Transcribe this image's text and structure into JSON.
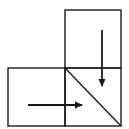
{
  "diagram": {
    "colors": {
      "background": "#ffffff",
      "stroke": "#1a1a1a"
    },
    "cells": [
      {
        "id": "top-cell",
        "x": 65,
        "y": 10,
        "w": 56,
        "h": 58
      },
      {
        "id": "bottom-left-cell",
        "x": 8,
        "y": 68,
        "w": 57,
        "h": 58
      },
      {
        "id": "bottom-right-cell",
        "x": 65,
        "y": 68,
        "w": 56,
        "h": 58
      }
    ],
    "diagonal": {
      "x1": 65,
      "y1": 68,
      "x2": 121,
      "y2": 126
    },
    "arrows": [
      {
        "id": "down-arrow",
        "direction": "down",
        "x1": 102,
        "y1": 30,
        "x2": 102,
        "y2": 86
      },
      {
        "id": "right-arrow",
        "direction": "right",
        "x1": 28,
        "y1": 105,
        "x2": 82,
        "y2": 105
      }
    ]
  }
}
